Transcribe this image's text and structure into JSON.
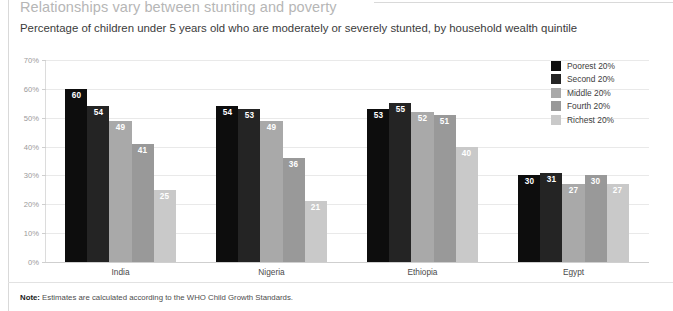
{
  "title": "Relationships vary between stunting and poverty",
  "subtitle": "Percentage of children under 5 years old who are moderately or severely stunted, by household wealth quintile",
  "note": {
    "label": "Note:",
    "text": " Estimates are calculated according to the WHO Child Growth Standards."
  },
  "chart_data": {
    "type": "bar",
    "title": "Relationships vary between stunting and poverty",
    "subtitle": "Percentage of children under 5 years old who are moderately or severely stunted, by household wealth quintile",
    "xlabel": "",
    "ylabel": "",
    "ylim": [
      0,
      70
    ],
    "grid": true,
    "legend_position": "top-right",
    "categories": [
      "India",
      "Nigeria",
      "Ethiopia",
      "Egypt"
    ],
    "ytick_labels": [
      "70%",
      "60%",
      "50%",
      "40%",
      "30%",
      "20%",
      "10%",
      "0%"
    ],
    "ytick_values": [
      70,
      60,
      50,
      40,
      30,
      20,
      10,
      0
    ],
    "series": [
      {
        "name": "Poorest 20%",
        "color": "#0d0d0d",
        "values": [
          60,
          54,
          53,
          30
        ]
      },
      {
        "name": "Second 20%",
        "color": "#242424",
        "values": [
          54,
          53,
          55,
          31
        ]
      },
      {
        "name": "Middle 20%",
        "color": "#a9a9a9",
        "values": [
          49,
          49,
          52,
          27
        ]
      },
      {
        "name": "Fourth 20%",
        "color": "#999999",
        "values": [
          41,
          36,
          51,
          30
        ]
      },
      {
        "name": "Richest 20%",
        "color": "#c9c9c9",
        "values": [
          25,
          21,
          40,
          27
        ]
      }
    ]
  }
}
